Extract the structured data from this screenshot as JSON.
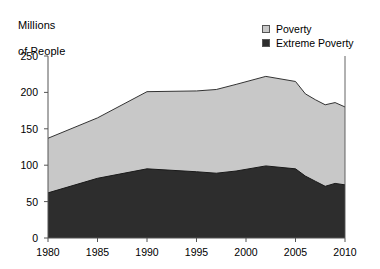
{
  "chart_data": {
    "type": "area",
    "stacked": true,
    "title": "",
    "subtitle": "",
    "xlabel": "",
    "ylabel": "Millions\nof People",
    "ylabel_lines": [
      "Millions",
      "of People"
    ],
    "xlim": [
      1980,
      2010
    ],
    "ylim": [
      0,
      250
    ],
    "grid": false,
    "legend_position": "top-right",
    "x": [
      1980,
      1985,
      1990,
      1995,
      1997,
      1999,
      2002,
      2005,
      2006,
      2007,
      2008,
      2009,
      2010
    ],
    "x_ticks": [
      1980,
      1985,
      1990,
      1995,
      2000,
      2005,
      2010
    ],
    "x_tick_labels": [
      "1980",
      "1985",
      "1990",
      "1995",
      "2000",
      "2005",
      "2010"
    ],
    "y_ticks": [
      0,
      50,
      100,
      150,
      200,
      250
    ],
    "y_tick_labels": [
      "0",
      "50",
      "100",
      "150",
      "200",
      "250"
    ],
    "series": [
      {
        "name": "Poverty",
        "color": "#c8c8c8",
        "values": [
          137,
          165,
          201,
          202,
          204,
          211,
          222,
          215,
          198,
          190,
          183,
          186,
          180
        ]
      },
      {
        "name": "Extreme Poverty",
        "color": "#2d2d2d",
        "values": [
          62,
          82,
          95,
          91,
          89,
          92,
          99,
          95,
          85,
          78,
          71,
          75,
          73
        ]
      }
    ]
  },
  "legend": {
    "items": [
      {
        "label": "Poverty",
        "color": "#c8c8c8"
      },
      {
        "label": "Extreme Poverty",
        "color": "#2d2d2d"
      }
    ]
  },
  "axis": {
    "y_title_line1": "Millions",
    "y_title_line2": "of People"
  }
}
